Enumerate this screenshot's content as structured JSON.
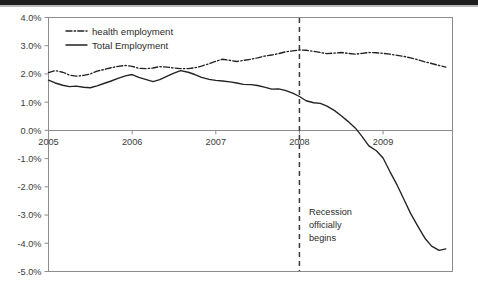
{
  "figure": {
    "top_bar_color": "#1d1d1d",
    "background_color": "#ffffff",
    "line_color": "#222222",
    "axis_color": "#8d8d8d"
  },
  "legend": {
    "position": "top-left-inside",
    "entries": [
      {
        "label": "health employment",
        "style": "dash-dot"
      },
      {
        "label": "Total Employment",
        "style": "solid"
      }
    ]
  },
  "annotation": {
    "lines": [
      "Recession",
      "officially",
      "begins"
    ],
    "marker_x": "2008.0",
    "marker_style": "dashed-vertical"
  },
  "chart_data": {
    "type": "line",
    "title": "",
    "xlabel": "",
    "ylabel": "",
    "xlim": [
      2005.0,
      2009.83
    ],
    "ylim": [
      -5.0,
      4.0
    ],
    "grid": false,
    "legend_position": "upper left",
    "xticks": [
      2005,
      2006,
      2007,
      2008,
      2009
    ],
    "xtick_labels": [
      "2005",
      "2006",
      "2007",
      "2008",
      "2009"
    ],
    "yticks": [
      -5.0,
      -4.0,
      -3.0,
      -2.0,
      -1.0,
      0.0,
      1.0,
      2.0,
      3.0,
      4.0
    ],
    "ytick_labels": [
      "-5.0%",
      "-4.0%",
      "-3.0%",
      "-2.0%",
      "-1.0%",
      "0.0%",
      "1.0%",
      "2.0%",
      "3.0%",
      "4.0%"
    ],
    "annotations": [
      {
        "type": "vline",
        "x": 2008.0,
        "text": "Recession officially begins"
      }
    ],
    "x": [
      2005.0,
      2005.08,
      2005.17,
      2005.25,
      2005.33,
      2005.42,
      2005.5,
      2005.58,
      2005.67,
      2005.75,
      2005.83,
      2005.92,
      2006.0,
      2006.08,
      2006.17,
      2006.25,
      2006.33,
      2006.42,
      2006.5,
      2006.58,
      2006.67,
      2006.75,
      2006.83,
      2006.92,
      2007.0,
      2007.08,
      2007.17,
      2007.25,
      2007.33,
      2007.42,
      2007.5,
      2007.58,
      2007.67,
      2007.75,
      2007.83,
      2007.92,
      2008.0,
      2008.08,
      2008.17,
      2008.25,
      2008.33,
      2008.42,
      2008.5,
      2008.58,
      2008.67,
      2008.75,
      2008.83,
      2008.92,
      2009.0,
      2009.08,
      2009.17,
      2009.25,
      2009.33,
      2009.42,
      2009.5,
      2009.58,
      2009.67,
      2009.75
    ],
    "series": [
      {
        "name": "health employment",
        "style": "dash-dot",
        "values": [
          2.05,
          2.12,
          2.06,
          1.96,
          1.92,
          1.95,
          2.0,
          2.1,
          2.16,
          2.22,
          2.27,
          2.3,
          2.27,
          2.2,
          2.19,
          2.21,
          2.26,
          2.24,
          2.21,
          2.19,
          2.19,
          2.22,
          2.28,
          2.36,
          2.45,
          2.52,
          2.48,
          2.44,
          2.48,
          2.52,
          2.57,
          2.63,
          2.67,
          2.72,
          2.78,
          2.82,
          2.85,
          2.84,
          2.8,
          2.76,
          2.72,
          2.74,
          2.76,
          2.73,
          2.7,
          2.73,
          2.76,
          2.75,
          2.73,
          2.7,
          2.66,
          2.62,
          2.57,
          2.5,
          2.43,
          2.37,
          2.3,
          2.24
        ]
      },
      {
        "name": "Total Employment",
        "style": "solid",
        "values": [
          1.78,
          1.68,
          1.6,
          1.55,
          1.57,
          1.53,
          1.51,
          1.58,
          1.67,
          1.75,
          1.84,
          1.93,
          1.98,
          1.88,
          1.8,
          1.73,
          1.8,
          1.92,
          2.03,
          2.12,
          2.06,
          1.98,
          1.88,
          1.81,
          1.77,
          1.75,
          1.72,
          1.68,
          1.63,
          1.62,
          1.59,
          1.53,
          1.46,
          1.47,
          1.42,
          1.32,
          1.2,
          1.05,
          0.98,
          0.96,
          0.86,
          0.7,
          0.52,
          0.32,
          0.08,
          -0.22,
          -0.55,
          -0.72,
          -0.98,
          -1.45,
          -1.95,
          -2.45,
          -2.95,
          -3.42,
          -3.82,
          -4.1,
          -4.25,
          -4.2
        ]
      }
    ]
  }
}
